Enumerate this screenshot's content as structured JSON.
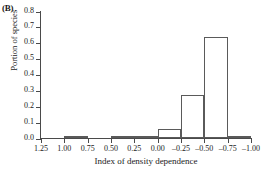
{
  "panel": {
    "label": "(B)"
  },
  "chart_data": {
    "type": "bar",
    "title": "",
    "xlabel": "Index of density dependence",
    "ylabel": "Portion of species",
    "ylim": [
      0,
      0.8
    ],
    "y_ticks": [
      "0.0",
      "0.1",
      "0.2",
      "0.3",
      "0.4",
      "0.5",
      "0.6",
      "0.7",
      "0.8"
    ],
    "y_tick_values": [
      0.0,
      0.1,
      0.2,
      0.3,
      0.4,
      0.5,
      0.6,
      0.7,
      0.8
    ],
    "x_ticks": [
      "1.25",
      "1.00",
      "0.75",
      "0.50",
      "0.25",
      "0.00",
      "–0.25",
      "–0.50",
      "–0.75",
      "–1.00"
    ],
    "x_tick_values": [
      1.25,
      1.0,
      0.75,
      0.5,
      0.25,
      0.0,
      -0.25,
      -0.5,
      -0.75,
      -1.0
    ],
    "x_axis_reversed": true,
    "grid": false,
    "legend": "none",
    "bar_style": {
      "fill": "#ffffff",
      "edge": "#5a5a5a"
    },
    "categories": [
      "1.25 to 1.00",
      "1.00 to 0.75",
      "0.75 to 0.50",
      "0.50 to 0.25",
      "0.25 to 0.00",
      "0.00 to –0.25",
      "–0.25 to –0.50",
      "–0.50 to –0.75",
      "–0.75 to –1.00"
    ],
    "values": [
      0.0,
      0.01,
      0.0,
      0.01,
      0.01,
      0.055,
      0.27,
      0.635,
      0.01
    ]
  }
}
